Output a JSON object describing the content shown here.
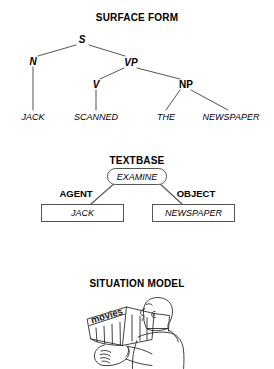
{
  "diagram": {
    "sections": [
      {
        "id": "surface_form",
        "title": "SURFACE FORM"
      },
      {
        "id": "textbase",
        "title": "TEXTBASE"
      },
      {
        "id": "situation_model",
        "title": "SITUATION MODEL"
      }
    ]
  },
  "surface_form": {
    "title": "SURFACE FORM",
    "nodes": {
      "s": "S",
      "n": "N",
      "vp": "VP",
      "v": "V",
      "np": "NP"
    },
    "terminals": {
      "jack": "JACK",
      "scanned": "SCANNED",
      "the": "THE",
      "newspaper": "NEWSPAPER"
    }
  },
  "textbase": {
    "title": "TEXTBASE",
    "predicate": "EXAMINE",
    "roles": {
      "agent_label": "AGENT",
      "object_label": "OBJECT"
    },
    "arguments": {
      "agent": "JACK",
      "object": "NEWSPAPER"
    }
  },
  "situation_model": {
    "title": "SITUATION MODEL",
    "illustration": {
      "description": "person-reading-newspaper",
      "newspaper_headline": "movies"
    }
  },
  "colors": {
    "ink": "#000000",
    "line": "#555555",
    "paper": "#ffffff"
  }
}
